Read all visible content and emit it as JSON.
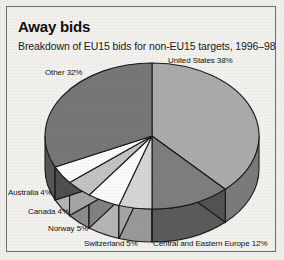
{
  "card": {
    "title": "Away bids",
    "subtitle": "Breakdown of EU15 bids for non-EU15 targets, 1996–98"
  },
  "chart_data": {
    "type": "pie",
    "title": "Away bids",
    "subtitle": "Breakdown of EU15 bids for non-EU15 targets, 1996–98",
    "xlabel": "",
    "ylabel": "",
    "unit": "percent",
    "three_d": true,
    "start_angle_deg": 0,
    "direction": "clockwise",
    "legend": "none (direct slice labels)",
    "grid": false,
    "categories": [
      "United States",
      "Central and Eastern Europe",
      "Switzerland",
      "Norway",
      "Canada",
      "Australia",
      "Other"
    ],
    "values": [
      38,
      12,
      5,
      5,
      4,
      4,
      32
    ],
    "labels": [
      "United States 38%",
      "Central and Eastern Europe 12%",
      "Switzerland 5%",
      "Norway 5%",
      "Canada 4%",
      "Australia 4%",
      "Other 32%"
    ],
    "colors": [
      "#ababab",
      "#7e7e7e",
      "#d5d5d5",
      "#fbfbfb",
      "#c3c3c3",
      "#fbfbfb",
      "#777777"
    ],
    "total": 100
  },
  "slice_labels": {
    "united_states": "United States 38%",
    "other": "Other 32%",
    "australia": "Australia 4%",
    "canada": "Canada 4%",
    "norway": "Norway 5%",
    "switzerland": "Switzerland 5%",
    "cee": "Central and Eastern Europe 12%"
  }
}
